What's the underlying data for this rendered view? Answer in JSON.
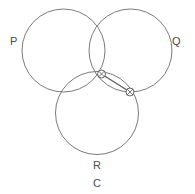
{
  "figure": {
    "width": 195,
    "height": 194,
    "background_color": "#ffffff",
    "stroke_color": "#6b6b6b",
    "label_color": "#4a4a4a",
    "marker_color": "#555555"
  },
  "circles": [
    {
      "id": "P",
      "label": "P",
      "cx": 63.5,
      "cy": 50.5,
      "r": 41.5
    },
    {
      "id": "Q",
      "label": "Q",
      "cx": 130.5,
      "cy": 50.5,
      "r": 41.5
    },
    {
      "id": "R",
      "label": "R",
      "cx": 97.0,
      "cy": 113.0,
      "r": 41.5
    }
  ],
  "labels": [
    {
      "name": "label-p",
      "text": "P",
      "x": 10,
      "y": 45
    },
    {
      "name": "label-q",
      "text": "Q",
      "x": 172,
      "y": 45
    },
    {
      "name": "label-r",
      "text": "R",
      "x": 93,
      "y": 169
    },
    {
      "name": "label-c",
      "text": "C",
      "x": 93,
      "y": 187
    }
  ],
  "markers": [
    {
      "name": "marker-point-1",
      "symbol": "crossed-circle",
      "x": 101.5,
      "y": 74.0,
      "r": 4.0
    },
    {
      "name": "marker-point-2",
      "symbol": "crossed-circle",
      "x": 130.0,
      "y": 92.0,
      "r": 4.0
    }
  ],
  "segment": {
    "name": "connector-segment",
    "x1": 101.5,
    "y1": 74.0,
    "x2": 130.0,
    "y2": 92.0
  }
}
